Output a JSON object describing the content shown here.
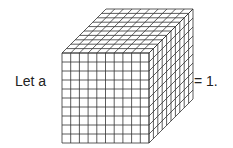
{
  "text": {
    "left": "Let a",
    "right": "= 1."
  },
  "cube": {
    "grid_divisions": 10,
    "front": {
      "x": 62,
      "y": 53,
      "w": 87,
      "h": 90
    },
    "depth_dx": 44,
    "depth_dy": -44,
    "stroke": "#333333"
  }
}
